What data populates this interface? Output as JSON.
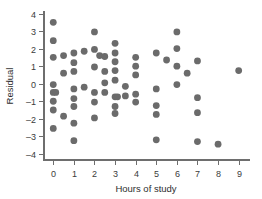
{
  "chart_data": {
    "type": "scatter",
    "title": "",
    "subtitle": "",
    "xlabel": "Hours of study",
    "ylabel": "Residual",
    "xlim": [
      -0.45,
      9.55
    ],
    "ylim": [
      -4.35,
      4.2
    ],
    "xticks": [
      0,
      1,
      2,
      3,
      4,
      5,
      6,
      7,
      8,
      9
    ],
    "xtick_labels": [
      "0",
      "1",
      "2",
      "3",
      "4",
      "5",
      "6",
      "7",
      "8",
      "9"
    ],
    "yticks": [
      -4,
      -3,
      -2,
      -1,
      0,
      1,
      2,
      3,
      4
    ],
    "ytick_labels": [
      "-4",
      "-3",
      "-2",
      "-1",
      "0",
      "1",
      "2",
      "3",
      "4"
    ],
    "grid": false,
    "legend": false,
    "legend_position": "none",
    "marker": "circle",
    "marker_color": "#6b6b6b",
    "marker_size": 3.4,
    "n_points": 74,
    "points": [
      [
        0.0,
        3.5
      ],
      [
        0.0,
        2.45
      ],
      [
        0.0,
        1.5
      ],
      [
        0.0,
        -0.05
      ],
      [
        0.0,
        -0.5
      ],
      [
        0.12,
        -0.5
      ],
      [
        0.0,
        -1.0
      ],
      [
        0.0,
        -1.5
      ],
      [
        0.0,
        -2.55
      ],
      [
        0.5,
        1.6
      ],
      [
        0.5,
        0.6
      ],
      [
        0.5,
        -1.85
      ],
      [
        1.0,
        1.75
      ],
      [
        1.0,
        1.2
      ],
      [
        1.0,
        0.7
      ],
      [
        1.0,
        -0.3
      ],
      [
        1.0,
        -0.85
      ],
      [
        1.0,
        -1.3
      ],
      [
        1.0,
        -2.25
      ],
      [
        1.0,
        -3.25
      ],
      [
        1.5,
        1.85
      ],
      [
        1.5,
        -0.2
      ],
      [
        2.0,
        2.95
      ],
      [
        2.0,
        1.95
      ],
      [
        2.0,
        0.95
      ],
      [
        2.0,
        -0.5
      ],
      [
        2.0,
        -1.05
      ],
      [
        2.0,
        -1.95
      ],
      [
        2.25,
        1.6
      ],
      [
        2.5,
        1.55
      ],
      [
        2.5,
        0.7
      ],
      [
        2.5,
        0.05
      ],
      [
        2.5,
        -0.5
      ],
      [
        3.0,
        2.3
      ],
      [
        3.0,
        1.75
      ],
      [
        3.0,
        1.25
      ],
      [
        3.0,
        0.75
      ],
      [
        3.0,
        0.2
      ],
      [
        3.0,
        -0.75
      ],
      [
        3.12,
        -0.75
      ],
      [
        3.0,
        -1.3
      ],
      [
        3.0,
        -1.7
      ],
      [
        3.5,
        -0.15
      ],
      [
        3.5,
        -0.7
      ],
      [
        4.0,
        1.5
      ],
      [
        4.0,
        1.0
      ],
      [
        4.0,
        0.5
      ],
      [
        4.0,
        -0.6
      ],
      [
        4.0,
        -1.05
      ],
      [
        5.0,
        1.75
      ],
      [
        5.0,
        -0.3
      ],
      [
        5.0,
        -1.25
      ],
      [
        5.0,
        -1.75
      ],
      [
        5.0,
        -3.2
      ],
      [
        5.5,
        1.35
      ],
      [
        6.0,
        2.95
      ],
      [
        6.0,
        2.0
      ],
      [
        6.0,
        1.0
      ],
      [
        6.0,
        -0.05
      ],
      [
        6.5,
        0.6
      ],
      [
        7.0,
        1.3
      ],
      [
        7.0,
        -0.8
      ],
      [
        7.0,
        -1.65
      ],
      [
        7.0,
        -3.3
      ],
      [
        8.0,
        -3.45
      ],
      [
        9.0,
        0.75
      ]
    ]
  },
  "axes": {
    "y_axis_name": "y-axis",
    "x_axis_name": "x-axis"
  }
}
